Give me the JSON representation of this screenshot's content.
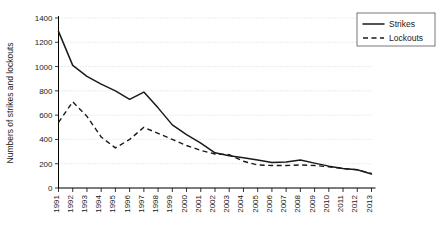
{
  "chart_data": {
    "type": "line",
    "title": "",
    "xlabel": "",
    "ylabel": "Numbers of strikes and lockouts",
    "ylim": [
      0,
      1400
    ],
    "ytick_values": [
      0,
      200,
      400,
      600,
      800,
      1000,
      1200,
      1400
    ],
    "yticks": [
      "0",
      "200",
      "400",
      "600",
      "800",
      "1000",
      "1200",
      "1400"
    ],
    "grid": true,
    "grid_axis": "y",
    "legend_position": "top-right",
    "categories": [
      "1991",
      "1992",
      "1993",
      "1994",
      "1995",
      "1996",
      "1997",
      "1998",
      "1999",
      "2000",
      "2001",
      "2002",
      "2003",
      "2004",
      "2005",
      "2006",
      "2007",
      "2008",
      "2009",
      "2010",
      "2011",
      "2012",
      "2013"
    ],
    "series": [
      {
        "name": "Strikes",
        "style": "solid",
        "color": "#1a1a1a",
        "values": [
          1290,
          1010,
          920,
          855,
          800,
          730,
          790,
          660,
          520,
          440,
          370,
          290,
          265,
          250,
          230,
          210,
          215,
          230,
          205,
          180,
          160,
          150,
          115
        ]
      },
      {
        "name": "Lockouts",
        "style": "dashed",
        "color": "#1a1a1a",
        "values": [
          540,
          710,
          590,
          420,
          330,
          400,
          500,
          450,
          400,
          350,
          310,
          280,
          275,
          220,
          190,
          185,
          185,
          190,
          185,
          175,
          160,
          150,
          120
        ]
      }
    ]
  },
  "legend": {
    "items": [
      {
        "label": "Strikes",
        "style": "solid"
      },
      {
        "label": "Lockouts",
        "style": "dashed"
      }
    ]
  },
  "axis": {
    "y_title": "Numbers of strikes and lockouts"
  }
}
